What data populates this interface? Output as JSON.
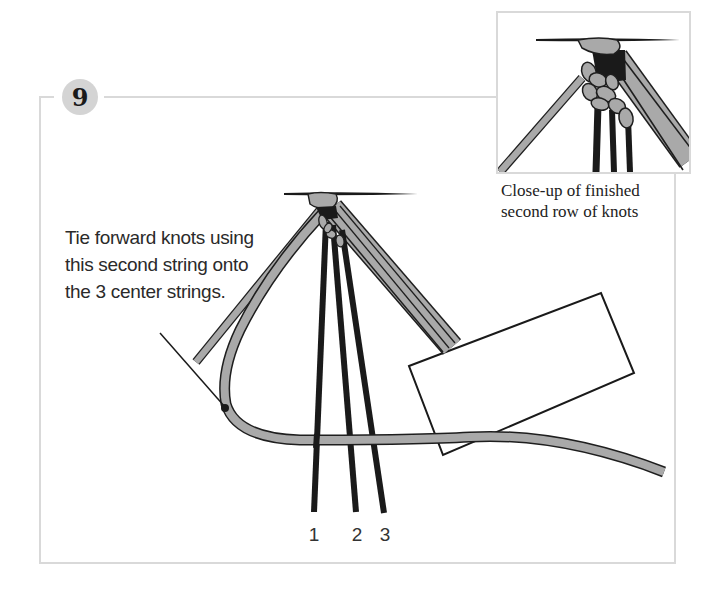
{
  "step": {
    "number": "9",
    "badge_color": "#d4d4d4"
  },
  "callout": {
    "lines": [
      "Tie forward knots using",
      "this second string onto",
      "the 3 center strings."
    ]
  },
  "inset": {
    "caption_lines": [
      "Close-up of finished",
      "second row of knots"
    ]
  },
  "string_labels": [
    "1",
    "2",
    "3"
  ],
  "colors": {
    "frame": "#d9d9d9",
    "cord_fill": "#a9a9a9",
    "cord_outline": "#1e1e1e",
    "center_strings": "#1a1a1a",
    "board": "#ffffff"
  }
}
